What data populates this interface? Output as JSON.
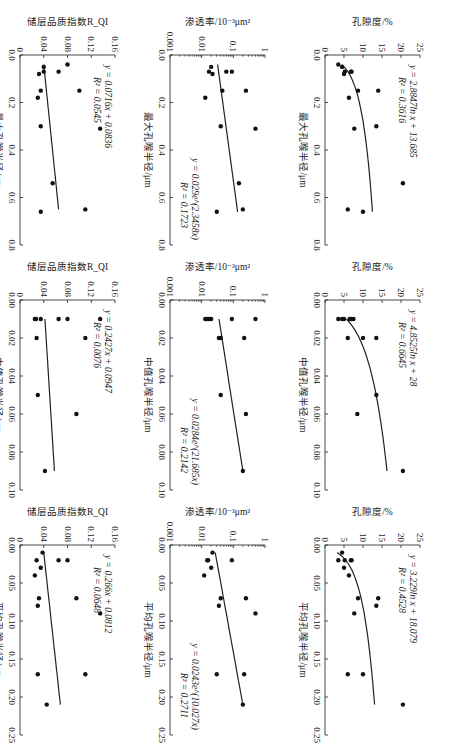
{
  "figure": {
    "rotation": "90deg-clockwise",
    "rows": [
      "孔隙度/%",
      "渗透率/10⁻³μm²",
      "储层品质指数R_QI"
    ],
    "columns": [
      "最大孔喉半径/μm",
      "中值孔喉半径/μm",
      "平均孔喉半径/μm"
    ]
  },
  "chart_data": [
    {
      "id": "porosity-vs-max",
      "type": "scatter",
      "xlabel": "最大孔喉半径/μm",
      "ylabel": "孔隙度/%",
      "xlim": [
        0,
        0.8
      ],
      "ylim": [
        0,
        25
      ],
      "xticks": [
        "0.0",
        "0.2",
        "0.4",
        "0.6",
        "0.8"
      ],
      "yticks": [
        "0",
        "5",
        "10",
        "15",
        "20",
        "25"
      ],
      "yscale": "linear",
      "points": [
        [
          0.15,
          14
        ],
        [
          0.3,
          13.5
        ],
        [
          0.54,
          20.5
        ],
        [
          0.66,
          10
        ],
        [
          0.65,
          6
        ],
        [
          0.31,
          7.7
        ],
        [
          0.18,
          6.3
        ],
        [
          0.15,
          8.7
        ],
        [
          0.07,
          7
        ],
        [
          0.07,
          6.8
        ],
        [
          0.08,
          5
        ],
        [
          0.07,
          5.2
        ],
        [
          0.05,
          4.5
        ],
        [
          0.04,
          3.5
        ]
      ],
      "fit": {
        "kind": "log",
        "a": 2.8847,
        "b": 13.685,
        "xrange": [
          0.04,
          0.66
        ]
      },
      "equation": "y = 2.8847ln x + 13.685",
      "r2": "R² = 0.3616"
    },
    {
      "id": "porosity-vs-median",
      "type": "scatter",
      "xlabel": "中值孔喉半径/μm",
      "ylabel": "孔隙度/%",
      "xlim": [
        0,
        0.1
      ],
      "ylim": [
        0,
        25
      ],
      "xticks": [
        "0.00",
        "0.02",
        "0.04",
        "0.06",
        "0.08",
        "0.10"
      ],
      "yticks": [
        "0",
        "5",
        "10",
        "15",
        "20",
        "25"
      ],
      "yscale": "linear",
      "points": [
        [
          0.09,
          20.5
        ],
        [
          0.05,
          13.5
        ],
        [
          0.06,
          8.5
        ],
        [
          0.02,
          13.5
        ],
        [
          0.02,
          10
        ],
        [
          0.02,
          6
        ],
        [
          0.01,
          7.5
        ],
        [
          0.01,
          7
        ],
        [
          0.01,
          6.5
        ],
        [
          0.01,
          5
        ],
        [
          0.01,
          4.5
        ],
        [
          0.01,
          3.5
        ]
      ],
      "fit": {
        "kind": "log",
        "a": 4.8525,
        "b": 28,
        "xrange": [
          0.01,
          0.09
        ]
      },
      "equation": "y = 4.8525ln x + 28",
      "r2": "R² = 0.6645"
    },
    {
      "id": "porosity-vs-mean",
      "type": "scatter",
      "xlabel": "平均孔喉半径/μm",
      "ylabel": "孔隙度/%",
      "xlim": [
        0,
        0.25
      ],
      "ylim": [
        0,
        25
      ],
      "xticks": [
        "0.00",
        "0.05",
        "0.10",
        "0.15",
        "0.20",
        "0.25"
      ],
      "yticks": [
        "0",
        "5",
        "10",
        "15",
        "20",
        "25"
      ],
      "yscale": "linear",
      "points": [
        [
          0.21,
          20.5
        ],
        [
          0.17,
          10
        ],
        [
          0.17,
          6
        ],
        [
          0.09,
          7.7
        ],
        [
          0.08,
          13.5
        ],
        [
          0.07,
          14
        ],
        [
          0.07,
          8.7
        ],
        [
          0.04,
          6.3
        ],
        [
          0.03,
          5
        ],
        [
          0.02,
          7
        ],
        [
          0.02,
          6.8
        ],
        [
          0.02,
          5.2
        ],
        [
          0.02,
          3.5
        ],
        [
          0.01,
          4.5
        ]
      ],
      "fit": {
        "kind": "log",
        "a": 3.229,
        "b": 18.079,
        "xrange": [
          0.01,
          0.21
        ]
      },
      "equation": "y = 3.229ln x + 18.079",
      "r2": "R² = 0.4528"
    },
    {
      "id": "permeability-vs-max",
      "type": "scatter",
      "xlabel": "最大孔喉半径/μm",
      "ylabel": "渗透率/10⁻³μm²",
      "xlim": [
        0,
        0.8
      ],
      "ylim": [
        0.001,
        1
      ],
      "xticks": [
        "0.0",
        "0.2",
        "0.4",
        "0.6",
        "0.8"
      ],
      "yticks": [
        "0.001",
        "0.01",
        "0.1",
        "1"
      ],
      "yscale": "log",
      "points": [
        [
          0.31,
          0.5
        ],
        [
          0.15,
          0.25
        ],
        [
          0.54,
          0.15
        ],
        [
          0.65,
          0.2
        ],
        [
          0.66,
          0.03
        ],
        [
          0.3,
          0.04
        ],
        [
          0.15,
          0.045
        ],
        [
          0.18,
          0.013
        ],
        [
          0.07,
          0.09
        ],
        [
          0.07,
          0.06
        ],
        [
          0.08,
          0.022
        ],
        [
          0.07,
          0.017
        ],
        [
          0.05,
          0.02
        ]
      ],
      "fit": {
        "kind": "exp",
        "a": 0.029,
        "b": 2.3458,
        "xrange": [
          0.04,
          0.66
        ]
      },
      "equation": "y = 0.029e^(2.3458x)",
      "r2": "R² = 0.1723"
    },
    {
      "id": "permeability-vs-median",
      "type": "scatter",
      "xlabel": "中值孔喉半径/μm",
      "ylabel": "渗透率/10⁻³μm²",
      "xlim": [
        0,
        0.1
      ],
      "ylim": [
        0.001,
        1
      ],
      "xticks": [
        "0.00",
        "0.02",
        "0.04",
        "0.06",
        "0.08",
        "0.10"
      ],
      "yticks": [
        "0.001",
        "0.01",
        "0.1",
        "1"
      ],
      "yscale": "log",
      "points": [
        [
          0.09,
          0.2
        ],
        [
          0.06,
          0.25
        ],
        [
          0.05,
          0.04
        ],
        [
          0.02,
          0.22
        ],
        [
          0.02,
          0.04
        ],
        [
          0.02,
          0.035
        ],
        [
          0.01,
          0.5
        ],
        [
          0.01,
          0.09
        ],
        [
          0.01,
          0.02
        ],
        [
          0.01,
          0.017
        ],
        [
          0.01,
          0.015
        ],
        [
          0.01,
          0.013
        ]
      ],
      "fit": {
        "kind": "exp",
        "a": 0.0284,
        "b": 21.685,
        "xrange": [
          0.01,
          0.09
        ]
      },
      "equation": "y = 0.0284e^(21.685x)",
      "r2": "R² = 0.2142"
    },
    {
      "id": "permeability-vs-mean",
      "type": "scatter",
      "xlabel": "平均孔喉半径/μm",
      "ylabel": "渗透率/10⁻³μm²",
      "xlim": [
        0,
        0.25
      ],
      "ylim": [
        0.001,
        1
      ],
      "xticks": [
        "0.00",
        "0.05",
        "0.10",
        "0.15",
        "0.20",
        "0.25"
      ],
      "yticks": [
        "0.001",
        "0.01",
        "0.1",
        "1"
      ],
      "yscale": "log",
      "points": [
        [
          0.21,
          0.2
        ],
        [
          0.17,
          0.22
        ],
        [
          0.17,
          0.03
        ],
        [
          0.09,
          0.5
        ],
        [
          0.08,
          0.035
        ],
        [
          0.07,
          0.25
        ],
        [
          0.07,
          0.04
        ],
        [
          0.04,
          0.012
        ],
        [
          0.03,
          0.02
        ],
        [
          0.02,
          0.09
        ],
        [
          0.02,
          0.015
        ],
        [
          0.02,
          0.016
        ],
        [
          0.01,
          0.022
        ]
      ],
      "fit": {
        "kind": "exp",
        "a": 0.0243,
        "b": 10.027,
        "xrange": [
          0.01,
          0.21
        ]
      },
      "equation": "y = 0.0243e^(10.027x)",
      "r2": "R² = 0.2711"
    },
    {
      "id": "rqi-vs-max",
      "type": "scatter",
      "xlabel": "最大孔喉半径/μm",
      "ylabel": "储层品质指数R_QI",
      "xlim": [
        0,
        0.8
      ],
      "ylim": [
        0,
        0.16
      ],
      "xticks": [
        "0.0",
        "0.2",
        "0.4",
        "0.6",
        "0.8"
      ],
      "yticks": [
        "0",
        "0.04",
        "0.08",
        "0.12",
        "0.16"
      ],
      "yscale": "linear",
      "points": [
        [
          0.31,
          0.135
        ],
        [
          0.65,
          0.11
        ],
        [
          0.15,
          0.1
        ],
        [
          0.54,
          0.055
        ],
        [
          0.66,
          0.035
        ],
        [
          0.3,
          0.035
        ],
        [
          0.15,
          0.035
        ],
        [
          0.18,
          0.03
        ],
        [
          0.07,
          0.065
        ],
        [
          0.04,
          0.08
        ],
        [
          0.07,
          0.04
        ],
        [
          0.08,
          0.032
        ],
        [
          0.05,
          0.04
        ]
      ],
      "fit": {
        "kind": "linear",
        "a": 0.0716,
        "b": 0.0836,
        "xrange": [
          0.04,
          0.65
        ],
        "display_yrange": [
          0.04,
          0.065
        ]
      },
      "equation": "y = 0.0716x + 0.0836",
      "r2": "R² = 0.0545"
    },
    {
      "id": "rqi-vs-median",
      "type": "scatter",
      "xlabel": "中值孔喉半径/μm",
      "ylabel": "储层品质指数R_QI",
      "xlim": [
        0,
        0.1
      ],
      "ylim": [
        0,
        0.16
      ],
      "xticks": [
        "0.00",
        "0.02",
        "0.04",
        "0.06",
        "0.08",
        "0.10"
      ],
      "yticks": [
        "0",
        "0.04",
        "0.08",
        "0.12",
        "0.16"
      ],
      "yscale": "linear",
      "points": [
        [
          0.09,
          0.042
        ],
        [
          0.06,
          0.095
        ],
        [
          0.05,
          0.03
        ],
        [
          0.02,
          0.11
        ],
        [
          0.02,
          0.028
        ],
        [
          0.01,
          0.135
        ],
        [
          0.01,
          0.08
        ],
        [
          0.01,
          0.065
        ],
        [
          0.01,
          0.035
        ],
        [
          0.01,
          0.025
        ],
        [
          0.01,
          0.027
        ]
      ],
      "fit": {
        "kind": "linear",
        "a": 0.2427,
        "b": 0.0947,
        "xrange": [
          0.01,
          0.09
        ],
        "display_yrange": [
          0.042,
          0.058
        ]
      },
      "equation": "y = 0.2427x + 0.0947",
      "r2": "R² = 0.0076"
    },
    {
      "id": "rqi-vs-mean",
      "type": "scatter",
      "xlabel": "平均孔喉半径/μm",
      "ylabel": "储层品质指数R_QI",
      "xlim": [
        0,
        0.25
      ],
      "ylim": [
        0,
        0.16
      ],
      "xticks": [
        "0.00",
        "0.05",
        "0.10",
        "0.15",
        "0.20",
        "0.25"
      ],
      "yticks": [
        "0",
        "0.04",
        "0.08",
        "0.12",
        "0.16"
      ],
      "yscale": "linear",
      "points": [
        [
          0.21,
          0.045
        ],
        [
          0.17,
          0.11
        ],
        [
          0.17,
          0.03
        ],
        [
          0.09,
          0.135
        ],
        [
          0.08,
          0.03
        ],
        [
          0.07,
          0.095
        ],
        [
          0.07,
          0.032
        ],
        [
          0.04,
          0.025
        ],
        [
          0.03,
          0.035
        ],
        [
          0.02,
          0.08
        ],
        [
          0.02,
          0.065
        ],
        [
          0.02,
          0.028
        ],
        [
          0.01,
          0.038
        ]
      ],
      "fit": {
        "kind": "linear",
        "a": 0.266,
        "b": 0.0812,
        "xrange": [
          0.01,
          0.21
        ],
        "display_yrange": [
          0.04,
          0.068
        ]
      },
      "equation": "y = 0.266x + 0.0812",
      "r2": "R² = 0.0648"
    }
  ]
}
